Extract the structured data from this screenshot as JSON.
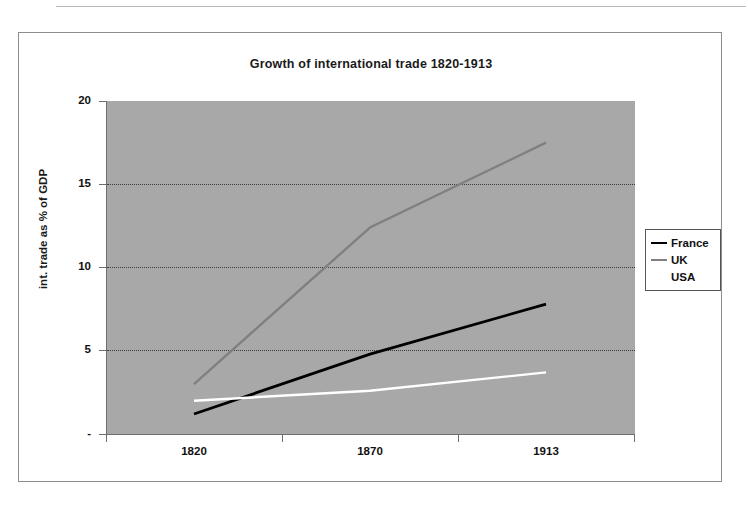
{
  "chart": {
    "title": "Growth of international trade 1820-1913",
    "y_axis_title": "int. trade as % of GDP",
    "y_tick_labels": [
      "20",
      "15",
      "10",
      "5",
      "-"
    ],
    "x_tick_labels": [
      "1820",
      "1870",
      "1913"
    ],
    "legend_items": [
      {
        "label": "France",
        "color": "#000000"
      },
      {
        "label": "UK",
        "color": "#808080"
      },
      {
        "label": "USA",
        "color": "#ffffff"
      }
    ],
    "plot_background": "#a8a8a8",
    "gridline_color": "#3a3a3a"
  },
  "chart_data": {
    "type": "line",
    "title": "Growth of international trade 1820-1913",
    "xlabel": "",
    "ylabel": "int. trade as % of GDP",
    "categories": [
      "1820",
      "1870",
      "1913"
    ],
    "ylim": [
      0,
      20
    ],
    "yticks": [
      0,
      5,
      10,
      15,
      20
    ],
    "grid": true,
    "legend_position": "right",
    "series": [
      {
        "name": "France",
        "color": "#000000",
        "values": [
          1.2,
          4.8,
          7.8
        ]
      },
      {
        "name": "UK",
        "color": "#808080",
        "values": [
          3.0,
          12.4,
          17.5
        ]
      },
      {
        "name": "USA",
        "color": "#ffffff",
        "values": [
          2.0,
          2.6,
          3.7
        ]
      }
    ]
  }
}
